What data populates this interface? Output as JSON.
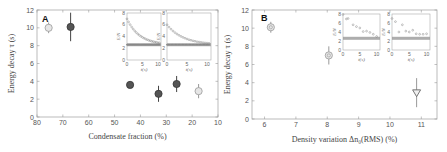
{
  "chart_data": [
    {
      "panel": "A",
      "type": "scatter",
      "title": "",
      "xlabel": "Condensate fraction (%)",
      "ylabel": "Energy decay τ (s)",
      "xlim": [
        80,
        10
      ],
      "ylim": [
        0,
        12
      ],
      "xticks": [
        80,
        70,
        60,
        50,
        40,
        30,
        20,
        10
      ],
      "yticks": [
        0,
        2,
        4,
        6,
        8,
        10,
        12
      ],
      "grid": false,
      "series": [
        {
          "name": "light",
          "color": "#c8c8c8",
          "points": [
            {
              "x": 75.5,
              "y": 10.0,
              "err": 0.6
            },
            {
              "x": 17.5,
              "y": 2.9,
              "err": 0.8
            }
          ]
        },
        {
          "name": "dark",
          "color": "#555555",
          "points": [
            {
              "x": 67,
              "y": 10.1,
              "err": 1.6
            },
            {
              "x": 44,
              "y": 3.6,
              "err": 0.3
            },
            {
              "x": 33,
              "y": 2.6,
              "err": 0.9
            },
            {
              "x": 26,
              "y": 3.7,
              "err": 0.9
            }
          ]
        }
      ],
      "insets": [
        {
          "xlabel": "t(s)",
          "ylabel": "E/N",
          "xticks": [
            0,
            5,
            10
          ],
          "yticks": [
            0,
            2,
            4,
            6,
            8
          ],
          "decay_from": 7.0,
          "baseline": 2.6
        },
        {
          "xlabel": "t(s)",
          "ylabel": "E/N",
          "xticks": [
            0,
            5,
            10
          ],
          "yticks": [
            0,
            2,
            4,
            6,
            8
          ],
          "decay_from": 6.0,
          "baseline": 2.6
        }
      ]
    },
    {
      "panel": "B",
      "type": "scatter",
      "title": "",
      "xlabel": "Density variation Δn₀(RMS) (%)",
      "ylabel": "Energy decay τ (s)",
      "xlim": [
        5.6,
        11.5
      ],
      "ylim": [
        0,
        12
      ],
      "xticks": [
        6,
        7,
        8,
        9,
        10,
        11
      ],
      "yticks": [
        0,
        2,
        4,
        6,
        8,
        10,
        12
      ],
      "grid": false,
      "series": [
        {
          "name": "data",
          "color": "#bbbbbb",
          "points": [
            {
              "x": 6.2,
              "y": 10.1,
              "err": 0.6,
              "marker": "circle"
            },
            {
              "x": 8.05,
              "y": 7.0,
              "err": 1.0,
              "marker": "circle"
            },
            {
              "x": 10.85,
              "y": 2.9,
              "err": 1.6,
              "marker": "triangle-down"
            }
          ]
        }
      ],
      "insets": [
        {
          "xlabel": "t(s)",
          "ylabel": "E/N",
          "xticks": [
            0,
            5,
            10
          ],
          "yticks": [
            0,
            2,
            4,
            6,
            8
          ],
          "points": [
            [
              0,
              7.9
            ],
            [
              1,
              6.9
            ],
            [
              1.5,
              7.0
            ],
            [
              3,
              5.6
            ],
            [
              4,
              5.2
            ],
            [
              5,
              4.9
            ],
            [
              6,
              4.1
            ],
            [
              7,
              4.2
            ],
            [
              8,
              3.9
            ],
            [
              9,
              3.5
            ],
            [
              10,
              3.0
            ]
          ],
          "baseline": 2.6
        },
        {
          "xlabel": "t(s)",
          "ylabel": "E/N",
          "xticks": [
            0,
            5,
            10
          ],
          "yticks": [
            0,
            2,
            4,
            6,
            8
          ],
          "points": [
            [
              0,
              7.0
            ],
            [
              1,
              6.3
            ],
            [
              2,
              4.0
            ],
            [
              3,
              5.6
            ],
            [
              4,
              4.2
            ],
            [
              5,
              4.0
            ],
            [
              6,
              4.4
            ],
            [
              7,
              3.6
            ],
            [
              8,
              3.5
            ],
            [
              9,
              3.5
            ],
            [
              10,
              3.6
            ]
          ],
          "baseline": 2.6
        }
      ]
    }
  ],
  "panels": {
    "a": {
      "label": "A",
      "xlabel": "Condensate fraction (%)",
      "ylabel": "Energy decay τ (s)"
    },
    "b": {
      "label": "B",
      "xlabel": "Density variation Δn₀(RMS) (%)",
      "ylabel": "Energy decay τ (s)"
    }
  }
}
